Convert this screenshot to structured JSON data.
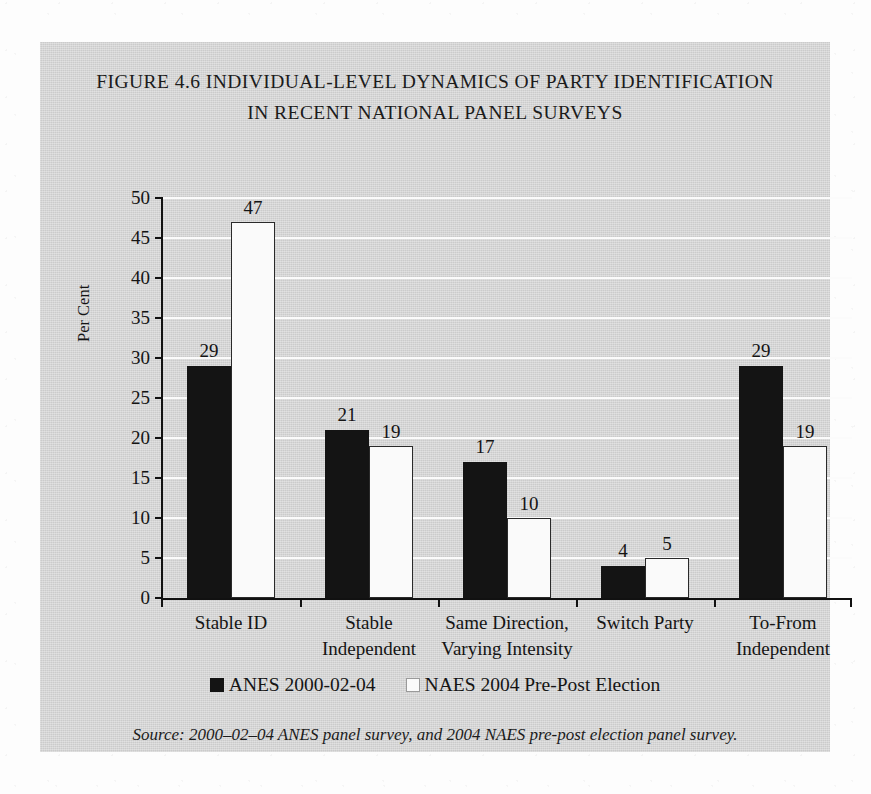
{
  "figure": {
    "title_line_1": "FIGURE 4.6 INDIVIDUAL-LEVEL DYNAMICS OF PARTY IDENTIFICATION",
    "title_line_2": "IN RECENT NATIONAL PANEL SURVEYS",
    "source_note": "Source: 2000–02–04 ANES panel survey, and 2004 NAES pre-post election panel survey.",
    "background_color": "#d2d2d2",
    "page_color": "#fdfdfd"
  },
  "chart_data": {
    "type": "bar",
    "title": "FIGURE 4.6 INDIVIDUAL-LEVEL DYNAMICS OF PARTY IDENTIFICATION IN RECENT NATIONAL PANEL SURVEYS",
    "xlabel": "",
    "ylabel": "Per Cent",
    "ylim": [
      0,
      50
    ],
    "ytick_step": 5,
    "yticks": [
      0,
      5,
      10,
      15,
      20,
      25,
      30,
      35,
      40,
      45,
      50
    ],
    "ytick_labels": [
      "0",
      "5",
      "10",
      "15",
      "20",
      "25",
      "30",
      "35",
      "40",
      "45",
      "50"
    ],
    "grid": true,
    "grid_axis": "y",
    "grid_color": "#fbfbfb",
    "legend_position": "bottom",
    "categories": [
      "Stable ID",
      "Stable Independent",
      "Same Direction, Varying Intensity",
      "Switch Party",
      "To-From Independent"
    ],
    "category_label_lines": [
      [
        "Stable ID"
      ],
      [
        "Stable",
        "Independent"
      ],
      [
        "Same Direction,",
        "Varying Intensity"
      ],
      [
        "Switch Party"
      ],
      [
        "To-From",
        "Independent"
      ]
    ],
    "series": [
      {
        "name": "ANES 2000-02-04",
        "color": "#141414",
        "values": [
          29,
          21,
          17,
          4,
          29
        ],
        "value_labels": [
          "29",
          "21",
          "17",
          "4",
          "29"
        ]
      },
      {
        "name": "NAES 2004 Pre-Post Election",
        "color": "#fafafa",
        "values": [
          47,
          19,
          10,
          5,
          19
        ],
        "value_labels": [
          "47",
          "19",
          "10",
          "5",
          "19"
        ]
      }
    ]
  }
}
